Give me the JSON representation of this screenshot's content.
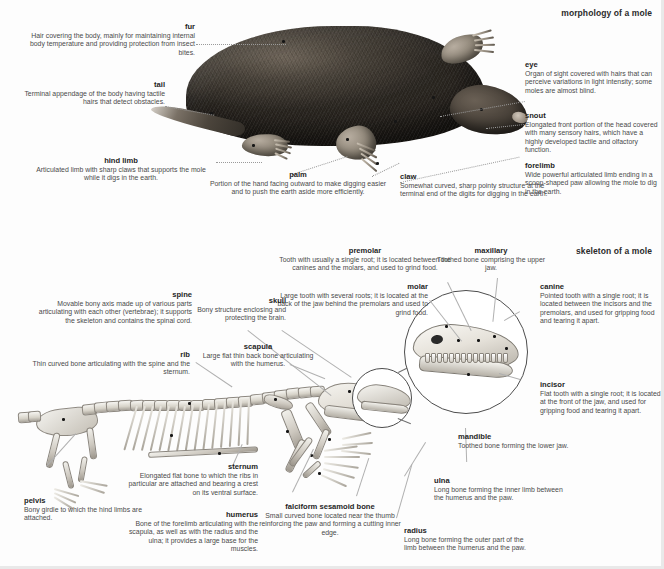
{
  "plate": {
    "sections": [
      {
        "id": "morphology",
        "title": "morphology of a mole"
      },
      {
        "id": "skeleton",
        "title": "skeleton of a mole"
      }
    ]
  },
  "morphology": {
    "title": "morphology of a mole",
    "callouts": [
      {
        "name": "fur",
        "term": "fur",
        "desc": "Hair covering the body, mainly for maintaining internal body temperature and providing protection from insect bites."
      },
      {
        "name": "tail",
        "term": "tail",
        "desc": "Terminal appendage of the body having tactile hairs that detect obstacles."
      },
      {
        "name": "hind-limb",
        "term": "hind limb",
        "desc": "Articulated limb with sharp claws that supports the mole while it digs in the earth."
      },
      {
        "name": "palm",
        "term": "palm",
        "desc": "Portion of the hand facing outward to make digging easier and to push the earth aside more efficiently."
      },
      {
        "name": "claw",
        "term": "claw",
        "desc": "Somewhat curved, sharp pointy structure at the terminal end of the digits for digging in the earth."
      },
      {
        "name": "eye",
        "term": "eye",
        "desc": "Organ of sight covered with hairs that can perceive variations in light intensity; some moles are almost blind."
      },
      {
        "name": "snout",
        "term": "snout",
        "desc": "Elongated front portion of the head covered with many sensory hairs, which have a highly developed tactile and olfactory function."
      },
      {
        "name": "forelimb",
        "term": "forelimb",
        "desc": "Wide powerful articulated limb ending in a scoop-shaped paw allowing the mole to dig in the earth."
      }
    ]
  },
  "skeleton": {
    "title": "skeleton of a mole",
    "callouts": [
      {
        "name": "premolar",
        "term": "premolar",
        "desc": "Tooth with usually a single root; it is located between the canines and the molars, and used to grind food."
      },
      {
        "name": "maxillary",
        "term": "maxillary",
        "desc": "Toothed bone comprising the upper jaw."
      },
      {
        "name": "molar",
        "term": "molar",
        "desc": "Large tooth with several roots; it is located at the back of the jaw behind the premolars and used to grind food."
      },
      {
        "name": "canine",
        "term": "canine",
        "desc": "Pointed tooth with a single root; it is located between the incisors and the premolars, and used for gripping food and tearing it apart."
      },
      {
        "name": "incisor",
        "term": "incisor",
        "desc": "Flat tooth with a single root; it is located at the front of the jaw, and used for gripping food and tearing it apart."
      },
      {
        "name": "mandible",
        "term": "mandible",
        "desc": "Toothed bone forming the lower jaw."
      },
      {
        "name": "skull",
        "term": "skull",
        "desc": "Bony structure enclosing and protecting the brain."
      },
      {
        "name": "spine",
        "term": "spine",
        "desc": "Movable bony axis made up of various parts articulating with each other (vertebrae); it supports the skeleton and contains the spinal cord."
      },
      {
        "name": "rib",
        "term": "rib",
        "desc": "Thin curved bone articulating with the spine and the sternum."
      },
      {
        "name": "scapula",
        "term": "scapula",
        "desc": "Large flat thin back bone articulating with the humerus."
      },
      {
        "name": "pelvis",
        "term": "pelvis",
        "desc": "Bony girdle to which the hind limbs are attached."
      },
      {
        "name": "sternum",
        "term": "sternum",
        "desc": "Elongated flat bone to which the ribs in particular are attached and bearing a crest on its ventral surface."
      },
      {
        "name": "humerus",
        "term": "humerus",
        "desc": "Bone of the forelimb articulating with the scapula, as well as with the radius and the ulna; it provides a large base for the muscles."
      },
      {
        "name": "falciform-sesamoid-bone",
        "term": "falciform sesamoid bone",
        "desc": "Small curved bone located near the thumb reinforcing the paw and forming a cutting inner edge."
      },
      {
        "name": "ulna",
        "term": "ulna",
        "desc": "Long bone forming the inner limb between the humerus and the paw."
      },
      {
        "name": "radius",
        "term": "radius",
        "desc": "Long bone forming the outer part of the limb between the humerus and the paw."
      }
    ]
  },
  "colors": {
    "page_background": "#ffffff",
    "text": "#4a4a4a",
    "term_text": "#1f1f1f",
    "leader_line": "#9a9a9a",
    "frame": "#e9e9e9",
    "bone_light": "#f4f3ef",
    "bone_dark": "#a9a49a",
    "fur_dark": "#2f2b26"
  }
}
